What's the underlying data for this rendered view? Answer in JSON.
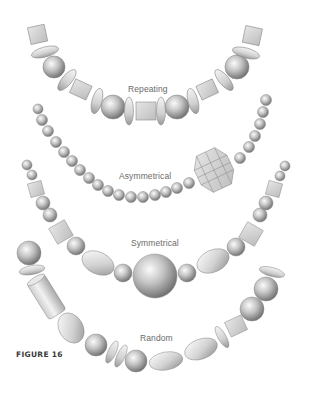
{
  "figure": {
    "label": "FIGURE 16",
    "necklaces": [
      {
        "name": "Repeating",
        "label": "Repeating"
      },
      {
        "name": "Asymmetrical",
        "label": "Asymmetrical"
      },
      {
        "name": "Symmetrical",
        "label": "Symmetrical"
      },
      {
        "name": "Random",
        "label": "Random"
      }
    ]
  },
  "colors": {
    "background": "#ffffff",
    "bead_light": "#f2f2f2",
    "bead_mid": "#b8b8b8",
    "bead_dark": "#6e6e6e",
    "cube_fill": "#d6d6d6",
    "outline": "#8a8a8a",
    "label_text": "#6a6a6a",
    "figure_label_text": "#3a3a3a"
  }
}
